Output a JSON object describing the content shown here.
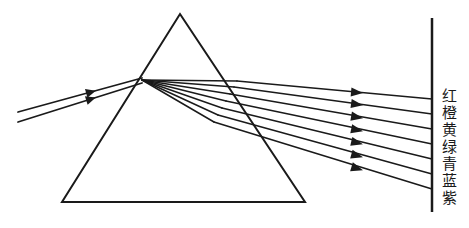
{
  "figure": {
    "kind": "optics-ray-diagram",
    "background_color": "#ffffff",
    "ink_color": "#1a1a1a"
  },
  "prism": {
    "name": "triangular-glass-prism",
    "apex": {
      "x": 180,
      "y": 14
    },
    "bottom_left": {
      "x": 62,
      "y": 202
    },
    "bottom_right": {
      "x": 305,
      "y": 202
    },
    "stroke_width": 2.0
  },
  "incident_beam": {
    "name": "incident-white-light-beam",
    "arrow_count": 2,
    "rays": [
      {
        "x1": 18,
        "y1": 112,
        "x2": 142,
        "y2": 78,
        "arrow_at": 0.62
      },
      {
        "x1": 18,
        "y1": 122,
        "x2": 142,
        "y2": 83,
        "arrow_at": 0.62
      }
    ]
  },
  "refraction_point": {
    "x": 142,
    "y": 80
  },
  "screen": {
    "name": "projection-screen",
    "x": 432,
    "y_top": 18,
    "y_bottom": 212,
    "stroke_width": 2.5
  },
  "dispersed_rays": [
    {
      "color_name": "红",
      "exit_x": 237,
      "exit_y": 81,
      "screen_y": 99,
      "arrow_x": 362,
      "arrow_y": 93
    },
    {
      "color_name": "橙",
      "exit_x": 234,
      "exit_y": 87,
      "screen_y": 114,
      "arrow_x": 362,
      "arrow_y": 105
    },
    {
      "color_name": "黄",
      "exit_x": 230,
      "exit_y": 94,
      "screen_y": 129,
      "arrow_x": 362,
      "arrow_y": 118
    },
    {
      "color_name": "绿",
      "exit_x": 226,
      "exit_y": 101,
      "screen_y": 144,
      "arrow_x": 362,
      "arrow_y": 131
    },
    {
      "color_name": "青",
      "exit_x": 222,
      "exit_y": 108,
      "screen_y": 159,
      "arrow_x": 362,
      "arrow_y": 144
    },
    {
      "color_name": "蓝",
      "exit_x": 218,
      "exit_y": 115,
      "screen_y": 174,
      "arrow_x": 362,
      "arrow_y": 157
    },
    {
      "color_name": "紫",
      "exit_x": 214,
      "exit_y": 122,
      "screen_y": 189,
      "arrow_x": 362,
      "arrow_y": 170
    }
  ],
  "spectrum_labels": [
    {
      "text": "红",
      "meaning": "red"
    },
    {
      "text": "橙",
      "meaning": "orange"
    },
    {
      "text": "黄",
      "meaning": "yellow"
    },
    {
      "text": "绿",
      "meaning": "green"
    },
    {
      "text": "青",
      "meaning": "cyan"
    },
    {
      "text": "蓝",
      "meaning": "blue"
    },
    {
      "text": "紫",
      "meaning": "violet"
    }
  ]
}
